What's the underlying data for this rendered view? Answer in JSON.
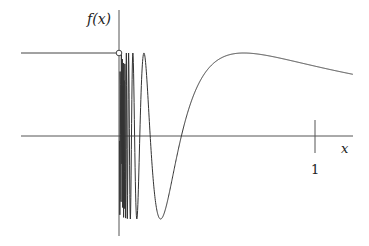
{
  "chart_data": {
    "type": "line",
    "title": "",
    "function": "f(x) = sin(1/x) for x > 0; f(x) = 1 for x < 0",
    "xlabel": "x",
    "ylabel": "f(x)",
    "x_ticks": [
      {
        "value": 1,
        "label": "1"
      }
    ],
    "xlim": [
      -0.5,
      1.2
    ],
    "ylim": [
      -1.1,
      1.35
    ],
    "grid": false,
    "legend": null,
    "series": [
      {
        "name": "left constant piece",
        "x": [
          -0.5,
          0
        ],
        "y": [
          1,
          1
        ],
        "endpoint": "open-circle at (0,1)"
      },
      {
        "name": "sin(1/x)",
        "x_range": [
          0,
          1.194
        ],
        "notable_points": [
          {
            "x": 0.127,
            "y": 1,
            "kind": "peak"
          },
          {
            "x": 0.212,
            "y": -1,
            "kind": "trough"
          },
          {
            "x": 0.318,
            "y": 0,
            "kind": "zero-crossing"
          },
          {
            "x": 0.637,
            "y": 1,
            "kind": "peak"
          },
          {
            "x": 1.0,
            "y": 0.841
          },
          {
            "x": 1.194,
            "y": 0.743
          }
        ]
      }
    ]
  },
  "labels": {
    "y_axis": "f(x)",
    "x_axis": "x",
    "tick_1": "1"
  },
  "geometry": {
    "origin_px": [
      119,
      136
    ],
    "unit_px": 196,
    "amp_px": 83,
    "x_axis_start": 21,
    "x_axis_end": 353,
    "y_axis_top": 10,
    "y_axis_bottom": 236
  },
  "colors": {
    "axis": "#555555",
    "curve": "#333333"
  }
}
